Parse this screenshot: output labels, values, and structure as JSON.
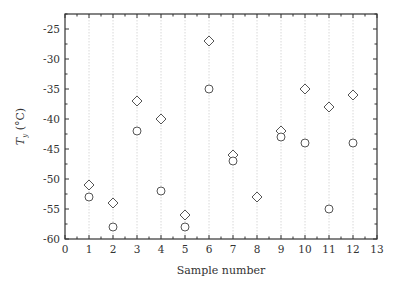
{
  "chart_data": {
    "type": "scatter",
    "title": "",
    "xlabel": "Sample number",
    "ylabel": "T_y (°C)",
    "ylabel_main": "T",
    "ylabel_sub": "y",
    "ylabel_unit": " (°C)",
    "xlim": [
      0,
      13
    ],
    "ylim": [
      -60,
      -22.5
    ],
    "xticks": [
      0,
      1,
      2,
      3,
      4,
      5,
      6,
      7,
      8,
      9,
      10,
      11,
      12,
      13
    ],
    "yticks": [
      -60,
      -55,
      -50,
      -45,
      -40,
      -35,
      -30,
      -25
    ],
    "grid": "vertical dotted at integer x",
    "legend": "none",
    "x": [
      1,
      2,
      3,
      4,
      5,
      6,
      7,
      8,
      9,
      10,
      11,
      12
    ],
    "series": [
      {
        "name": "diamond",
        "marker": "diamond",
        "values": [
          -51,
          -54,
          -37,
          -40,
          -56,
          -27,
          -46,
          -53,
          -42,
          -35,
          -38,
          -36
        ]
      },
      {
        "name": "circle",
        "marker": "circle",
        "values": [
          -53,
          -58,
          -42,
          -52,
          -58,
          -35,
          -47,
          null,
          -43,
          -44,
          -55,
          -44
        ]
      }
    ]
  },
  "style": {
    "axis_color": "#333333",
    "grid_color": "#d8d8d8",
    "marker_color": "#555555"
  }
}
